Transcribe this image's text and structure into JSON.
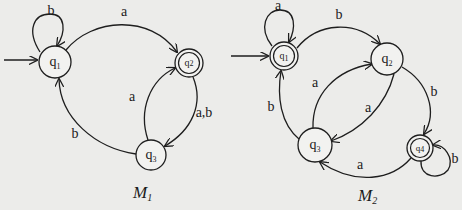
{
  "colors": {
    "background": "#ececea",
    "stroke": "#1e1e1e",
    "node_fill": "#f2f2f0"
  },
  "machines": [
    {
      "caption": {
        "base": "M",
        "sub": "1"
      },
      "start_state": "q1",
      "accept_states": [
        "q2"
      ],
      "states": [
        {
          "id": "q1",
          "base": "q",
          "sub": "1",
          "accepting": false,
          "start": true
        },
        {
          "id": "q2",
          "base": "q",
          "sub": "2",
          "accepting": true,
          "start": false
        },
        {
          "id": "q3",
          "base": "q",
          "sub": "3",
          "accepting": false,
          "start": false
        }
      ],
      "transitions": [
        {
          "from": "q1",
          "to": "q1",
          "label": "b"
        },
        {
          "from": "q1",
          "to": "q2",
          "label": "a"
        },
        {
          "from": "q2",
          "to": "q3",
          "label": "a,b"
        },
        {
          "from": "q3",
          "to": "q2",
          "label": "a"
        },
        {
          "from": "q3",
          "to": "q1",
          "label": "b"
        }
      ]
    },
    {
      "caption": {
        "base": "M",
        "sub": "2"
      },
      "start_state": "q1",
      "accept_states": [
        "q1",
        "q4"
      ],
      "states": [
        {
          "id": "q1",
          "base": "q",
          "sub": "1",
          "accepting": true,
          "start": true
        },
        {
          "id": "q2",
          "base": "q",
          "sub": "2",
          "accepting": false,
          "start": false
        },
        {
          "id": "q3",
          "base": "q",
          "sub": "3",
          "accepting": false,
          "start": false
        },
        {
          "id": "q4",
          "base": "q",
          "sub": "4",
          "accepting": true,
          "start": false
        }
      ],
      "transitions": [
        {
          "from": "q1",
          "to": "q1",
          "label": "a"
        },
        {
          "from": "q1",
          "to": "q2",
          "label": "b"
        },
        {
          "from": "q2",
          "to": "q3",
          "label": "a"
        },
        {
          "from": "q3",
          "to": "q2",
          "label": "a"
        },
        {
          "from": "q2",
          "to": "q4",
          "label": "b"
        },
        {
          "from": "q4",
          "to": "q4",
          "label": "b"
        },
        {
          "from": "q4",
          "to": "q3",
          "label": "a"
        },
        {
          "from": "q3",
          "to": "q1",
          "label": "b"
        }
      ]
    }
  ]
}
